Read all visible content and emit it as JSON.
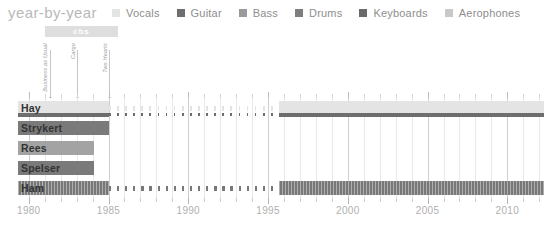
{
  "header": {
    "title": "year-by-year"
  },
  "legend": {
    "items": [
      {
        "label": "Vocals",
        "color": "#e4e4e4"
      },
      {
        "label": "Guitar",
        "color": "#6e6e6e"
      },
      {
        "label": "Bass",
        "color": "#9a9a9a"
      },
      {
        "label": "Drums",
        "color": "#7e7e7e"
      },
      {
        "label": "Keyboards",
        "color": "#6a6a6a"
      },
      {
        "label": "Aerophones",
        "color": "#c8c8c8"
      }
    ]
  },
  "axis": {
    "min": 1979.2,
    "max": 2012.3,
    "major_ticks": [
      1980,
      1985,
      1990,
      1995,
      2000,
      2005,
      2010
    ],
    "tick_labels": [
      "1980",
      "1985",
      "1990",
      "1995",
      "2000",
      "2005",
      "2010"
    ],
    "minor_step": 1
  },
  "annotations": {
    "label_bars": [
      {
        "text": "cbs",
        "start": 1981.0,
        "end": 1985.6,
        "color": "#dedede"
      }
    ],
    "albums": [
      {
        "text": "Business as Usual",
        "year": 1981.3
      },
      {
        "text": "Cargo",
        "year": 1983.0
      },
      {
        "text": "Two Hearts",
        "year": 1985.0
      }
    ]
  },
  "chart_data": {
    "type": "bar",
    "title": "year-by-year",
    "xlabel": "",
    "ylabel": "",
    "xlim": [
      1979.2,
      2012.3
    ],
    "grid": true,
    "legend_position": "top-right",
    "categories": [
      "Hay",
      "Strykert",
      "Rees",
      "Spelser",
      "Ham"
    ],
    "series": [
      {
        "name": "Hay",
        "segments": [
          {
            "role": "Vocals",
            "color": "#e4e4e4",
            "start": 1979.3,
            "end": 1985.0,
            "style": "solid",
            "lane": "main"
          },
          {
            "role": "Vocals",
            "color": "#e4e4e4",
            "start": 1985.0,
            "end": 1995.7,
            "style": "dotted",
            "lane": "main"
          },
          {
            "role": "Vocals",
            "color": "#e4e4e4",
            "start": 1995.7,
            "end": 2012.3,
            "style": "solid",
            "lane": "main"
          },
          {
            "role": "Guitar",
            "color": "#6e6e6e",
            "start": 1979.3,
            "end": 1985.0,
            "style": "solid",
            "lane": "thin"
          },
          {
            "role": "Guitar",
            "color": "#6e6e6e",
            "start": 1985.0,
            "end": 1995.7,
            "style": "dotted",
            "lane": "thin"
          },
          {
            "role": "Guitar",
            "color": "#6e6e6e",
            "start": 1995.7,
            "end": 2012.3,
            "style": "solid",
            "lane": "thin"
          }
        ]
      },
      {
        "name": "Strykert",
        "segments": [
          {
            "role": "Guitar",
            "color": "#7a7a7a",
            "start": 1979.3,
            "end": 1985.0,
            "style": "solid",
            "lane": "main"
          }
        ]
      },
      {
        "name": "Rees",
        "segments": [
          {
            "role": "Bass",
            "color": "#a3a3a3",
            "start": 1979.3,
            "end": 1984.1,
            "style": "solid",
            "lane": "main"
          }
        ]
      },
      {
        "name": "Spelser",
        "segments": [
          {
            "role": "Keyboards",
            "color": "#7a7a7a",
            "start": 1979.3,
            "end": 1984.1,
            "style": "solid",
            "lane": "main"
          }
        ]
      },
      {
        "name": "Ham",
        "segments": [
          {
            "role": "Drums",
            "color": "#787878",
            "start": 1979.3,
            "end": 1985.0,
            "style": "hatch",
            "lane": "main"
          },
          {
            "role": "Drums",
            "color": "#787878",
            "start": 1985.0,
            "end": 1995.7,
            "style": "dashed",
            "lane": "main"
          },
          {
            "role": "Drums",
            "color": "#787878",
            "start": 1995.7,
            "end": 2012.3,
            "style": "hatch",
            "lane": "main"
          }
        ]
      }
    ]
  }
}
